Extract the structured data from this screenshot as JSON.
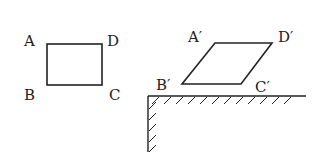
{
  "figure1": {
    "labels": {
      "A": "A",
      "B": "B",
      "C": "C",
      "D": "D"
    }
  },
  "figure2": {
    "labels": {
      "A": "A′",
      "B": "B′",
      "C": "C′",
      "D": "D′"
    }
  },
  "colors": {
    "stroke": "#222222",
    "background": "#ffffff"
  }
}
